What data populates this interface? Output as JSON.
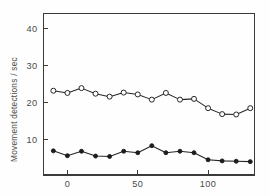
{
  "chart_data": {
    "type": "line",
    "title": "",
    "subtitle": "",
    "xlabel": "",
    "ylabel": "Movement detections / sec",
    "xlim": [
      -17,
      133
    ],
    "ylim": [
      0.5,
      44
    ],
    "xticks": [
      0,
      50,
      100
    ],
    "xtick_labels": [
      "0",
      "50",
      "100"
    ],
    "yticks": [
      10,
      20,
      30,
      40
    ],
    "ytick_labels": [
      "10",
      "20",
      "30",
      "40"
    ],
    "grid": false,
    "legend": "none",
    "x": [
      -10,
      0,
      10,
      20,
      30,
      40,
      50,
      60,
      70,
      80,
      90,
      100,
      110,
      120,
      130
    ],
    "series": [
      {
        "name": "open-circles",
        "marker": "open-circle",
        "color": "#272727",
        "values": [
          23.2,
          22.6,
          23.9,
          22.4,
          21.6,
          22.7,
          22.2,
          20.8,
          22.6,
          20.8,
          21.0,
          18.5,
          16.9,
          16.8,
          18.5
        ]
      },
      {
        "name": "filled-circles",
        "marker": "filled-circle",
        "color": "#1c1c1c",
        "values": [
          7.0,
          5.7,
          6.9,
          5.6,
          5.5,
          6.9,
          6.5,
          8.4,
          6.5,
          6.9,
          6.5,
          4.6,
          4.3,
          4.2,
          4.1
        ]
      }
    ]
  },
  "figure": {
    "ylabel": "Movement detections / sec",
    "xtick_labels": [
      "0",
      "50",
      "100"
    ],
    "ytick_labels": [
      "10",
      "20",
      "30",
      "40"
    ]
  }
}
